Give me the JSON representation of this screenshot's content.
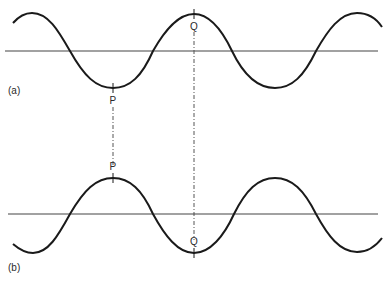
{
  "figure": {
    "panel_a": {
      "label": "(a)",
      "point_p": "P",
      "point_q": "Q",
      "description": "Wave with trough at P and crest at Q"
    },
    "panel_b": {
      "label": "(b)",
      "point_p": "P",
      "point_q": "Q",
      "description": "Inverted wave with crest at P and trough at Q"
    }
  },
  "colors": {
    "wave": "#1a1a1a",
    "axis": "#444444",
    "guide": "#555555",
    "text": "#2a2a2a"
  }
}
